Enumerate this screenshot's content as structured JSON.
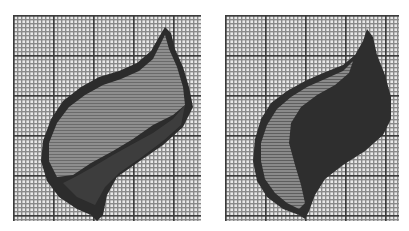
{
  "figure": {
    "panels": [
      {
        "id": "left",
        "description": "Pixelated leaf silhouette on grid paper, lighter gray fill with dark outline and dark lower stem region",
        "fill_color": "#8c8c8c",
        "shadow_color": "#3a3a3a",
        "outline_color": "#2a2a2a"
      },
      {
        "id": "right",
        "description": "Pixelated leaf silhouette on grid paper, mostly dark fill with lighter gray left edge region",
        "fill_color": "#8a8a8a",
        "shadow_color": "#323232",
        "outline_color": "#262626"
      }
    ],
    "grid": {
      "background": "#e8e8e8",
      "minor_line_color": "#8a8a8a",
      "major_line_color": "#3c3c3c"
    }
  }
}
